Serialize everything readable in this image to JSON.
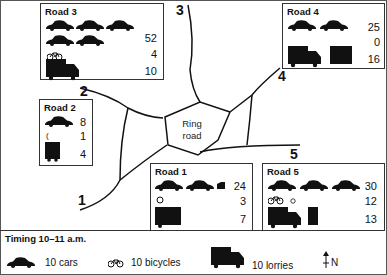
{
  "roads": [
    {
      "id": "road-1",
      "title": "Road 1",
      "cars": 24,
      "bicycles": 3,
      "lorries": 7,
      "marker": "1"
    },
    {
      "id": "road-2",
      "title": "Road 2",
      "cars": 8,
      "bicycles": 1,
      "lorries": 4,
      "marker": "2"
    },
    {
      "id": "road-3",
      "title": "Road 3",
      "cars": 52,
      "bicycles": 4,
      "lorries": 10,
      "marker": "3"
    },
    {
      "id": "road-4",
      "title": "Road 4",
      "cars": 25,
      "bicycles": 0,
      "lorries": 16,
      "marker": "4"
    },
    {
      "id": "road-5",
      "title": "Road 5",
      "cars": 30,
      "bicycles": 12,
      "lorries": 13,
      "marker": "5"
    }
  ],
  "ring_road": {
    "line1": "Ring",
    "line2": "road"
  },
  "legend": {
    "timing": "Timing 10–11 a.m.",
    "cars": "10 cars",
    "bicycles": "10 bicycles",
    "lorries": "10 lorries",
    "north": "N"
  },
  "icons": {
    "car": "car-icon",
    "bicycle": "bicycle-icon",
    "lorry": "lorry-icon",
    "north": "north-arrow-icon"
  }
}
